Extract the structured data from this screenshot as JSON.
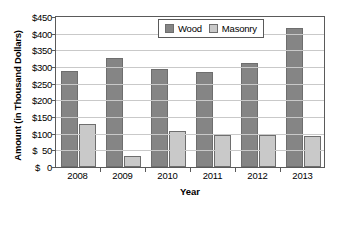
{
  "chart_data": {
    "type": "bar",
    "title": "",
    "xlabel": "Year",
    "ylabel": "Amount (in Thousand Dollars)",
    "categories": [
      "2008",
      "2009",
      "2010",
      "2011",
      "2012",
      "2013"
    ],
    "series": [
      {
        "name": "Wood",
        "color": "#858585",
        "values": [
          288,
          328,
          295,
          285,
          313,
          418
        ]
      },
      {
        "name": "Masonry",
        "color": "#c9c9c9",
        "values": [
          130,
          33,
          108,
          97,
          97,
          92
        ]
      }
    ],
    "ylim": [
      0,
      450
    ],
    "ytick_labels": [
      "$450",
      "$400",
      "$350",
      "$300",
      "$250",
      "$200",
      "$150",
      "$100",
      "$  50",
      "$   0"
    ],
    "ytick_values": [
      450,
      400,
      350,
      300,
      250,
      200,
      150,
      100,
      50,
      0
    ],
    "grid": true,
    "legend_position": "top-right-inside"
  },
  "legend": {
    "entries": [
      {
        "label": "Wood"
      },
      {
        "label": "Masonry"
      }
    ]
  }
}
